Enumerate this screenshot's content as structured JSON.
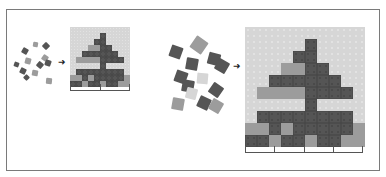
{
  "figure": {
    "colors": {
      "light": "#d6d6d6",
      "mid": "#9c9c9c",
      "dark": "#555555",
      "frame": "#7a7a7a"
    },
    "arrow_glyph": "➜",
    "legend": {
      "light": "sky background",
      "mid": "light brick / ground",
      "dark": "dark brick"
    },
    "grid_rows": 10,
    "grid_cols": 10,
    "grid": [
      "LLLLLLLLLL",
      "LLLLLDLLLL",
      "LLLLDDLLLL",
      "LLLMMDDLLL",
      "LLDDDDDDLL",
      "LMMMMDDDDL",
      "LLLLLDLLLL",
      "LDDDDDDDDL",
      "MMDMDDDDDM",
      "DDMDDMDDMM"
    ],
    "panels": [
      {
        "name": "small",
        "grid": {
          "x": 70,
          "y": 27,
          "cell": 6
        },
        "scale": {
          "x": 70,
          "y": 90,
          "width": 60,
          "ticks": 3
        },
        "arrow": {
          "x": 58,
          "y": 58
        },
        "bricks": [
          {
            "x": 22,
            "y": 48,
            "s": 6,
            "r": 30,
            "c": "dark"
          },
          {
            "x": 33,
            "y": 42,
            "s": 5,
            "r": 10,
            "c": "mid"
          },
          {
            "x": 43,
            "y": 43,
            "s": 6,
            "r": 45,
            "c": "dark"
          },
          {
            "x": 14,
            "y": 62,
            "s": 5,
            "r": 20,
            "c": "dark"
          },
          {
            "x": 25,
            "y": 58,
            "s": 6,
            "r": 15,
            "c": "mid"
          },
          {
            "x": 42,
            "y": 55,
            "s": 6,
            "r": 35,
            "c": "mid"
          },
          {
            "x": 20,
            "y": 68,
            "s": 6,
            "r": 25,
            "c": "dark"
          },
          {
            "x": 37,
            "y": 62,
            "s": 6,
            "r": 40,
            "c": "dark"
          },
          {
            "x": 45,
            "y": 60,
            "s": 6,
            "r": 20,
            "c": "dark"
          },
          {
            "x": 24,
            "y": 75,
            "s": 5,
            "r": 45,
            "c": "dark"
          },
          {
            "x": 32,
            "y": 70,
            "s": 6,
            "r": 10,
            "c": "mid"
          },
          {
            "x": 46,
            "y": 78,
            "s": 6,
            "r": 5,
            "c": "mid"
          }
        ]
      },
      {
        "name": "large",
        "grid": {
          "x": 245,
          "y": 27,
          "cell": 12
        },
        "scale": {
          "x": 245,
          "y": 152,
          "width": 118,
          "ticks": 5
        },
        "arrow": {
          "x": 233,
          "y": 62
        },
        "bricks": [
          {
            "x": 170,
            "y": 46,
            "s": 12,
            "r": 20,
            "c": "dark"
          },
          {
            "x": 192,
            "y": 38,
            "s": 14,
            "r": 35,
            "c": "mid"
          },
          {
            "x": 186,
            "y": 58,
            "s": 12,
            "r": 10,
            "c": "dark"
          },
          {
            "x": 208,
            "y": 53,
            "s": 12,
            "r": 15,
            "c": "dark"
          },
          {
            "x": 216,
            "y": 60,
            "s": 12,
            "r": 30,
            "c": "dark"
          },
          {
            "x": 175,
            "y": 71,
            "s": 12,
            "r": 20,
            "c": "dark"
          },
          {
            "x": 182,
            "y": 80,
            "s": 12,
            "r": 10,
            "c": "dark"
          },
          {
            "x": 197,
            "y": 73,
            "s": 11,
            "r": 5,
            "c": "light"
          },
          {
            "x": 186,
            "y": 88,
            "s": 11,
            "r": 15,
            "c": "light"
          },
          {
            "x": 210,
            "y": 84,
            "s": 12,
            "r": 35,
            "c": "dark"
          },
          {
            "x": 198,
            "y": 97,
            "s": 12,
            "r": 25,
            "c": "dark"
          },
          {
            "x": 210,
            "y": 100,
            "s": 12,
            "r": 30,
            "c": "mid"
          },
          {
            "x": 172,
            "y": 98,
            "s": 12,
            "r": 10,
            "c": "mid"
          }
        ]
      }
    ]
  }
}
